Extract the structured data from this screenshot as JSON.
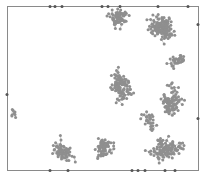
{
  "figure": {
    "width": 203,
    "height": 177,
    "background": "#ffffff",
    "frame": {
      "x": 7,
      "y": 6,
      "width": 191,
      "height": 164,
      "stroke": "#8a8a8a",
      "stroke_width": 1
    },
    "particle": {
      "fill": "#8f8f8f",
      "edge_fill": "#555555",
      "radius": 1.5,
      "bond_stroke": "#b5b5b5",
      "bond_width": 0.7
    },
    "clusters": [
      {
        "name": "top-center",
        "cx": 118,
        "cy": 22,
        "spread": 16,
        "count": 70,
        "seed": 11
      },
      {
        "name": "top-right",
        "cx": 162,
        "cy": 30,
        "spread": 20,
        "count": 150,
        "seed": 23
      },
      {
        "name": "right-upper-tail",
        "cx": 180,
        "cy": 58,
        "spread": 9,
        "count": 35,
        "seed": 31
      },
      {
        "name": "center",
        "cx": 127,
        "cy": 85,
        "spread": 14,
        "count": 110,
        "seed": 47
      },
      {
        "name": "right-middle",
        "cx": 175,
        "cy": 100,
        "spread": 14,
        "count": 90,
        "seed": 53
      },
      {
        "name": "center-bridge",
        "cx": 150,
        "cy": 118,
        "spread": 8,
        "count": 30,
        "seed": 61
      },
      {
        "name": "bottom-left",
        "cx": 65,
        "cy": 150,
        "spread": 14,
        "count": 70,
        "seed": 71
      },
      {
        "name": "bottom-center",
        "cx": 105,
        "cy": 148,
        "spread": 15,
        "count": 70,
        "seed": 83
      },
      {
        "name": "bottom-right",
        "cx": 160,
        "cy": 152,
        "spread": 16,
        "count": 120,
        "seed": 97
      },
      {
        "name": "left-fragment",
        "cx": 12,
        "cy": 115,
        "spread": 4,
        "count": 8,
        "seed": 101
      }
    ],
    "edge_particles": [
      [
        50,
        6
      ],
      [
        55,
        6
      ],
      [
        62,
        6
      ],
      [
        102,
        6
      ],
      [
        108,
        6
      ],
      [
        120,
        6
      ],
      [
        158,
        6
      ],
      [
        188,
        6
      ],
      [
        50,
        170
      ],
      [
        68,
        170
      ],
      [
        132,
        170
      ],
      [
        138,
        170
      ],
      [
        145,
        170
      ],
      [
        165,
        170
      ],
      [
        175,
        170
      ],
      [
        198,
        24
      ],
      [
        198,
        118
      ],
      [
        7,
        94
      ]
    ]
  }
}
